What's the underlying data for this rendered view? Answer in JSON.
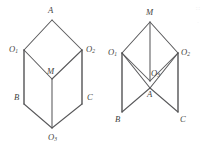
{
  "page": {
    "background_color": "#ffffff",
    "line_color": "#58585a",
    "label_color": "#3f3f41",
    "width": 207,
    "height": 147
  },
  "figures": [
    {
      "id": "left-figure",
      "name": "rhombic-prism-left",
      "description": "Upper rhombus A-O1-M-O2 over lower rhombus O1-B-O3-C sharing vertical edges",
      "vertices": [
        {
          "id": "A",
          "label": "A",
          "sub": "",
          "x": 52,
          "y": 20,
          "label_x": 48,
          "label_y": 11
        },
        {
          "id": "O1",
          "label": "O",
          "sub": "1",
          "x": 24,
          "y": 50,
          "label_x": 9,
          "label_y": 50
        },
        {
          "id": "O2",
          "label": "O",
          "sub": "2",
          "x": 82,
          "y": 50,
          "label_x": 86,
          "label_y": 50
        },
        {
          "id": "M",
          "label": "M",
          "sub": "",
          "x": 52,
          "y": 79,
          "label_x": 47,
          "label_y": 72
        },
        {
          "id": "B",
          "label": "B",
          "sub": "",
          "x": 24,
          "y": 104,
          "label_x": 14,
          "label_y": 98
        },
        {
          "id": "C",
          "label": "C",
          "sub": "",
          "x": 82,
          "y": 104,
          "label_x": 87,
          "label_y": 98
        },
        {
          "id": "O3",
          "label": "O",
          "sub": "3",
          "x": 52,
          "y": 128,
          "label_x": 48,
          "label_y": 138
        }
      ],
      "edges": [
        {
          "from": "A",
          "to": "O1",
          "weight": "normal"
        },
        {
          "from": "A",
          "to": "O2",
          "weight": "normal"
        },
        {
          "from": "O1",
          "to": "M",
          "weight": "normal"
        },
        {
          "from": "O2",
          "to": "M",
          "weight": "normal"
        },
        {
          "from": "O1",
          "to": "B",
          "weight": "strong"
        },
        {
          "from": "O2",
          "to": "C",
          "weight": "strong"
        },
        {
          "from": "M",
          "to": "O3",
          "weight": "normal"
        },
        {
          "from": "B",
          "to": "O3",
          "weight": "normal"
        },
        {
          "from": "C",
          "to": "O3",
          "weight": "normal"
        }
      ]
    },
    {
      "id": "right-figure",
      "name": "folded-rhombic-solid-right",
      "description": "Apex M with legs to O1 and O2, crossing edges meeting at O3 and A near center, feet at B and C",
      "vertices": [
        {
          "id": "M",
          "label": "M",
          "sub": "",
          "x": 150,
          "y": 22,
          "label_x": 146,
          "label_y": 13
        },
        {
          "id": "O1",
          "label": "O",
          "sub": "1",
          "x": 122,
          "y": 53,
          "label_x": 108,
          "label_y": 53
        },
        {
          "id": "O2",
          "label": "O",
          "sub": "2",
          "x": 178,
          "y": 53,
          "label_x": 181,
          "label_y": 53
        },
        {
          "id": "O3",
          "label": "O",
          "sub": "3",
          "x": 150,
          "y": 81,
          "label_x": 151,
          "label_y": 74
        },
        {
          "id": "A",
          "label": "A",
          "sub": "",
          "x": 150,
          "y": 88,
          "label_x": 147,
          "label_y": 95
        },
        {
          "id": "B",
          "label": "B",
          "sub": "",
          "x": 122,
          "y": 112,
          "label_x": 115,
          "label_y": 120
        },
        {
          "id": "C",
          "label": "C",
          "sub": "",
          "x": 178,
          "y": 112,
          "label_x": 180,
          "label_y": 120
        }
      ],
      "edges": [
        {
          "from": "M",
          "to": "O1",
          "weight": "normal"
        },
        {
          "from": "M",
          "to": "O2",
          "weight": "normal"
        },
        {
          "from": "M",
          "to": "O3",
          "weight": "normal"
        },
        {
          "from": "O1",
          "to": "O3",
          "weight": "normal"
        },
        {
          "from": "O2",
          "to": "O3",
          "weight": "normal"
        },
        {
          "from": "O1",
          "to": "A",
          "weight": "normal"
        },
        {
          "from": "O2",
          "to": "A",
          "weight": "normal"
        },
        {
          "from": "O1",
          "to": "B",
          "weight": "strong"
        },
        {
          "from": "O2",
          "to": "C",
          "weight": "strong"
        },
        {
          "from": "A",
          "to": "B",
          "weight": "normal"
        },
        {
          "from": "A",
          "to": "C",
          "weight": "normal"
        }
      ]
    }
  ],
  "corner_marks": [
    {
      "id": "mark-1",
      "text": "∷",
      "x": 196,
      "y": 10
    },
    {
      "id": "mark-2",
      "text": "·",
      "x": 197,
      "y": 25
    }
  ]
}
